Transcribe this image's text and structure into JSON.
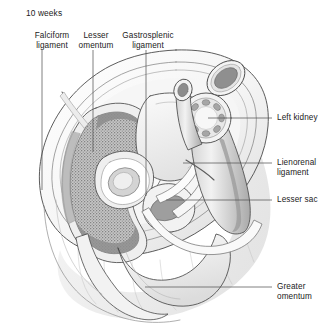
{
  "figure": {
    "stage_label": "10 weeks",
    "type": "anatomical-cross-section",
    "background_color": "#ffffff",
    "ink_color": "#3c3c3c"
  },
  "labels": {
    "top": [
      {
        "id": "falciform-ligament",
        "text": "Falciform\nligament",
        "x": 52,
        "y": 32,
        "leader": {
          "x1": 42,
          "y1": 50,
          "x2": 42,
          "y2": 190
        }
      },
      {
        "id": "lesser-omentum",
        "text": "Lesser\nomentum",
        "x": 102,
        "y": 32,
        "leader": {
          "x1": 93,
          "y1": 50,
          "x2": 93,
          "y2": 152
        }
      },
      {
        "id": "gastrosplenic-ligament",
        "text": "Gastrosplenic\nligament",
        "x": 160,
        "y": 32,
        "leader": {
          "x1": 146,
          "y1": 50,
          "x2": 146,
          "y2": 196
        }
      }
    ],
    "right": [
      {
        "id": "left-kidney",
        "text": "Left kidney",
        "x": 277,
        "y": 118,
        "leader": {
          "x1": 272,
          "y1": 118,
          "x2": 208,
          "y2": 118
        }
      },
      {
        "id": "lienorenal-ligament",
        "text": "Lienorenal\nligament",
        "x": 277,
        "y": 160,
        "leader": {
          "x1": 272,
          "y1": 163,
          "x2": 183,
          "y2": 163
        }
      },
      {
        "id": "lesser-sac",
        "text": "Lesser sac",
        "x": 277,
        "y": 197,
        "leader": {
          "x1": 272,
          "y1": 200,
          "x2": 166,
          "y2": 200
        }
      },
      {
        "id": "greater-omentum",
        "text": "Greater\nomentum",
        "x": 277,
        "y": 283,
        "leader": {
          "x1": 272,
          "y1": 287,
          "x2": 145,
          "y2": 287
        }
      }
    ]
  },
  "structures": {
    "body_wall": "outer abdominal wall ellipse",
    "liver": "stippled crescent, left side",
    "kidney": "circle with ring of calyces, right",
    "vessels": "aorta and vena cava cross-sections, upper right",
    "stomach": "central pale lumen",
    "greater_omentum": "inferior draping flap",
    "calyx_count": 8
  },
  "palette": {
    "outline": "#4a4a4a",
    "liver_fill": "#a8a8a8",
    "liver_rim": "#8e8e8e",
    "pale_tissue": "#f0f0f0",
    "mid_tissue": "#d8d8d8",
    "dark_tissue": "#9a9a9a",
    "vessel_dark": "#8c8c8c",
    "leader_line": "#555555"
  }
}
